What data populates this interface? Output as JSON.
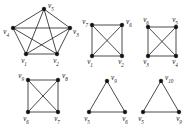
{
  "figure": {
    "title": "",
    "background": "#ffffff",
    "edge_color": "#1a1a1a",
    "vertex_color": "#111111",
    "label_color": "#151515",
    "width": 189,
    "height": 130,
    "graph_count": 6
  },
  "chart_data": {
    "type": "diagram",
    "subtype": "graph-collection",
    "title": "",
    "xlabel": "",
    "ylabel": "",
    "graphs": [
      {
        "id": "graph-1",
        "shape": "pentagon-with-chords",
        "position": "top-left",
        "vertices": [
          {
            "id": "v5",
            "label": "v",
            "sub": "5",
            "x": 44,
            "y": 9,
            "label_x": 48,
            "label_y": 6,
            "label_anchor": "start"
          },
          {
            "id": "v4",
            "label": "v",
            "sub": "4",
            "x": 13,
            "y": 28,
            "label_x": 9,
            "label_y": 32,
            "label_anchor": "end"
          },
          {
            "id": "v3",
            "label": "v",
            "sub": "3",
            "x": 70,
            "y": 28,
            "label_x": 73,
            "label_y": 32,
            "label_anchor": "start"
          },
          {
            "id": "v1",
            "label": "v",
            "sub": "1",
            "x": 26,
            "y": 54,
            "label_x": 24,
            "label_y": 61,
            "label_anchor": "middle"
          },
          {
            "id": "v2",
            "label": "v",
            "sub": "2",
            "x": 57,
            "y": 54,
            "label_x": 56,
            "label_y": 61,
            "label_anchor": "middle"
          }
        ],
        "edges": [
          [
            "v5",
            "v4"
          ],
          [
            "v5",
            "v3"
          ],
          [
            "v4",
            "v3"
          ],
          [
            "v4",
            "v1"
          ],
          [
            "v3",
            "v2"
          ],
          [
            "v1",
            "v2"
          ],
          [
            "v5",
            "v1"
          ],
          [
            "v5",
            "v2"
          ],
          [
            "v4",
            "v2"
          ],
          [
            "v3",
            "v1"
          ]
        ],
        "edge_count": 10,
        "vertex_count": 5
      },
      {
        "id": "graph-2",
        "shape": "square-with-diagonals",
        "position": "top-middle",
        "vertices": [
          {
            "id": "v7",
            "label": "v",
            "sub": "7",
            "x": 92,
            "y": 25,
            "label_x": 88,
            "label_y": 22,
            "label_anchor": "end"
          },
          {
            "id": "v6",
            "label": "v",
            "sub": "6",
            "x": 122,
            "y": 25,
            "label_x": 126,
            "label_y": 22,
            "label_anchor": "start"
          },
          {
            "id": "v1",
            "label": "v",
            "sub": "1",
            "x": 92,
            "y": 56,
            "label_x": 90,
            "label_y": 62,
            "label_anchor": "middle"
          },
          {
            "id": "v2",
            "label": "v",
            "sub": "2",
            "x": 122,
            "y": 56,
            "label_x": 121,
            "label_y": 62,
            "label_anchor": "middle"
          }
        ],
        "edges": [
          [
            "v7",
            "v6"
          ],
          [
            "v7",
            "v1"
          ],
          [
            "v6",
            "v2"
          ],
          [
            "v1",
            "v2"
          ],
          [
            "v7",
            "v2"
          ],
          [
            "v6",
            "v1"
          ]
        ],
        "edge_count": 6,
        "vertex_count": 4
      },
      {
        "id": "graph-3",
        "shape": "square-with-diagonals",
        "position": "top-right",
        "vertices": [
          {
            "id": "v6",
            "label": "v",
            "sub": "6",
            "x": 148,
            "y": 27,
            "label_x": 146,
            "label_y": 20,
            "label_anchor": "middle"
          },
          {
            "id": "v5",
            "label": "v",
            "sub": "5",
            "x": 176,
            "y": 27,
            "label_x": 175,
            "label_y": 20,
            "label_anchor": "middle"
          },
          {
            "id": "v3",
            "label": "v",
            "sub": "3",
            "x": 148,
            "y": 56,
            "label_x": 146,
            "label_y": 62,
            "label_anchor": "middle"
          },
          {
            "id": "v4",
            "label": "v",
            "sub": "4",
            "x": 176,
            "y": 56,
            "label_x": 175,
            "label_y": 62,
            "label_anchor": "middle"
          }
        ],
        "edges": [
          [
            "v6",
            "v5"
          ],
          [
            "v6",
            "v3"
          ],
          [
            "v5",
            "v4"
          ],
          [
            "v3",
            "v4"
          ],
          [
            "v6",
            "v4"
          ],
          [
            "v5",
            "v3"
          ]
        ],
        "edge_count": 6,
        "vertex_count": 4
      },
      {
        "id": "graph-4",
        "shape": "square-with-diagonals",
        "position": "bottom-left",
        "vertices": [
          {
            "id": "v9",
            "label": "v",
            "sub": "9",
            "x": 28,
            "y": 80,
            "label_x": 24,
            "label_y": 76,
            "label_anchor": "end"
          },
          {
            "id": "v8",
            "label": "v",
            "sub": "8",
            "x": 58,
            "y": 80,
            "label_x": 62,
            "label_y": 76,
            "label_anchor": "start"
          },
          {
            "id": "v6",
            "label": "v",
            "sub": "6",
            "x": 28,
            "y": 112,
            "label_x": 26,
            "label_y": 119,
            "label_anchor": "middle"
          },
          {
            "id": "v7",
            "label": "v",
            "sub": "7",
            "x": 58,
            "y": 112,
            "label_x": 57,
            "label_y": 119,
            "label_anchor": "middle"
          }
        ],
        "edges": [
          [
            "v9",
            "v8"
          ],
          [
            "v9",
            "v6"
          ],
          [
            "v8",
            "v7"
          ],
          [
            "v6",
            "v7"
          ],
          [
            "v9",
            "v7"
          ],
          [
            "v8",
            "v6"
          ]
        ],
        "edge_count": 6,
        "vertex_count": 4
      },
      {
        "id": "graph-5",
        "shape": "triangle",
        "position": "bottom-middle",
        "vertices": [
          {
            "id": "v9",
            "label": "v",
            "sub": "9",
            "x": 107,
            "y": 81,
            "label_x": 111,
            "label_y": 78,
            "label_anchor": "start"
          },
          {
            "id": "v5",
            "label": "v",
            "sub": "5",
            "x": 89,
            "y": 112,
            "label_x": 87,
            "label_y": 119,
            "label_anchor": "middle"
          },
          {
            "id": "v6",
            "label": "v",
            "sub": "6",
            "x": 125,
            "y": 112,
            "label_x": 125,
            "label_y": 119,
            "label_anchor": "middle"
          }
        ],
        "edges": [
          [
            "v9",
            "v5"
          ],
          [
            "v9",
            "v6"
          ],
          [
            "v5",
            "v6"
          ]
        ],
        "edge_count": 3,
        "vertex_count": 3
      },
      {
        "id": "graph-6",
        "shape": "triangle",
        "position": "bottom-right",
        "vertices": [
          {
            "id": "v10",
            "label": "v",
            "sub": "10",
            "x": 161,
            "y": 81,
            "label_x": 165,
            "label_y": 78,
            "label_anchor": "start"
          },
          {
            "id": "v5",
            "label": "v",
            "sub": "5",
            "x": 143,
            "y": 112,
            "label_x": 141,
            "label_y": 119,
            "label_anchor": "middle"
          },
          {
            "id": "v9",
            "label": "v",
            "sub": "9",
            "x": 179,
            "y": 112,
            "label_x": 179,
            "label_y": 119,
            "label_anchor": "middle"
          }
        ],
        "edges": [
          [
            "v10",
            "v5"
          ],
          [
            "v10",
            "v9"
          ],
          [
            "v5",
            "v9"
          ]
        ],
        "edge_count": 3,
        "vertex_count": 3
      }
    ]
  }
}
